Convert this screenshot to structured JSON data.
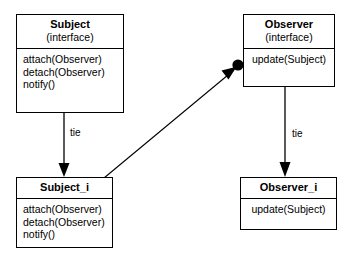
{
  "diagram": {
    "line_color": "#000000",
    "box_fill": "#ffffff",
    "boxes": [
      {
        "id": "subject",
        "title": "Subject",
        "stereotype": "(interface)",
        "members": [
          "attach(Observer)",
          "detach(Observer)",
          "notify()"
        ]
      },
      {
        "id": "observer",
        "title": "Observer",
        "stereotype": "(interface)",
        "members": [
          "update(Subject)"
        ]
      },
      {
        "id": "subject_i",
        "title": "Subject_i",
        "stereotype": "",
        "members": [
          "attach(Observer)",
          "detach(Observer)",
          "notify()"
        ]
      },
      {
        "id": "observer_i",
        "title": "Observer_i",
        "stereotype": "",
        "members": [
          "update(Subject)"
        ]
      }
    ],
    "edges": [
      {
        "id": "subject-tie",
        "label": "tie",
        "from": "subject",
        "to": "subject_i",
        "style": "arrow"
      },
      {
        "id": "observer-tie",
        "label": "tie",
        "from": "observer",
        "to": "observer_i",
        "style": "arrow"
      },
      {
        "id": "subject_i-observer",
        "label": "",
        "from": "subject_i",
        "to": "observer",
        "style": "arrow-with-ball"
      }
    ]
  }
}
